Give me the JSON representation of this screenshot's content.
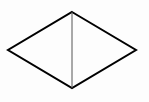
{
  "diagram": {
    "type": "rhombus-with-diagonal",
    "background": "#fdfdfd",
    "stroke_color": "#000000",
    "diagonal_color": "#555555",
    "vertices": {
      "top": [
        72,
        12
      ],
      "right": [
        136,
        50
      ],
      "bottom": [
        72,
        88
      ],
      "left": [
        8,
        50
      ]
    },
    "diagonal": {
      "from": "top",
      "to": "bottom"
    },
    "labels": []
  }
}
